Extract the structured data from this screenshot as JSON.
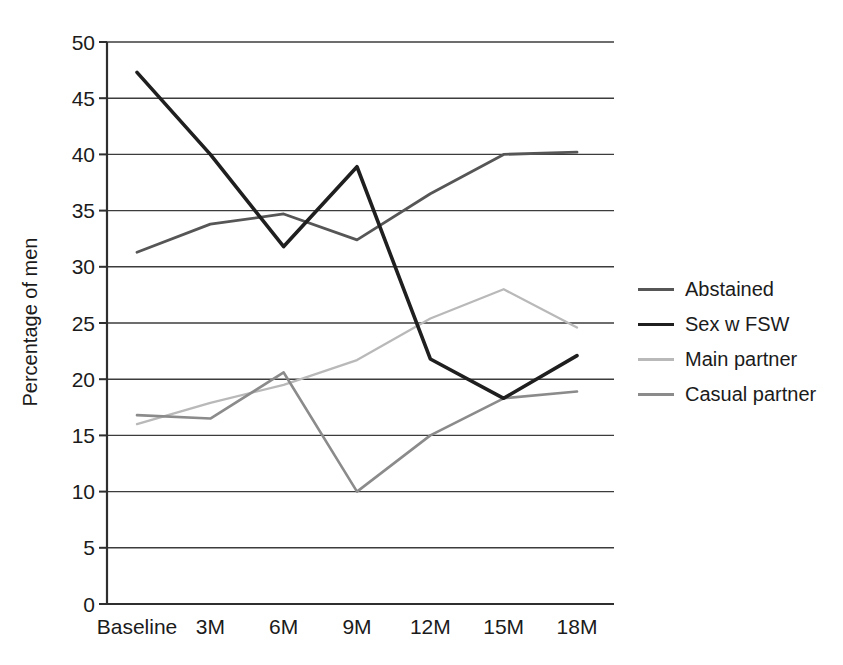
{
  "figure": {
    "background": "#ffffff",
    "text_color": "#1b1b1b",
    "axis_color": "#2f2f2f",
    "grid_color": "#3c3c3c"
  },
  "chart_data": {
    "type": "line",
    "title": "",
    "ylabel": "Percentage of men",
    "xlabel": "",
    "categories": [
      "Baseline",
      "3M",
      "6M",
      "9M",
      "12M",
      "15M",
      "18M"
    ],
    "series": [
      {
        "name": "Abstained",
        "color": "#565656",
        "stroke_width": 2.8,
        "values": [
          31.3,
          33.8,
          34.7,
          32.4,
          36.5,
          40.0,
          40.2
        ]
      },
      {
        "name": "Sex w FSW",
        "color": "#1f1f1f",
        "stroke_width": 3.6,
        "values": [
          47.3,
          40.0,
          31.8,
          38.9,
          21.8,
          18.3,
          22.1
        ]
      },
      {
        "name": "Main partner",
        "color": "#b9b9b9",
        "stroke_width": 2.3,
        "values": [
          16.0,
          17.9,
          19.5,
          21.7,
          25.4,
          28.0,
          24.6
        ]
      },
      {
        "name": "Casual partner",
        "color": "#8b8b8b",
        "stroke_width": 2.6,
        "values": [
          16.8,
          16.5,
          20.6,
          10.0,
          15.0,
          18.3,
          18.9
        ]
      }
    ],
    "ylim": [
      0,
      50
    ],
    "y_ticks": [
      0,
      5,
      10,
      15,
      20,
      25,
      30,
      35,
      40,
      45,
      50
    ],
    "grid": true,
    "legend_position": "right"
  }
}
